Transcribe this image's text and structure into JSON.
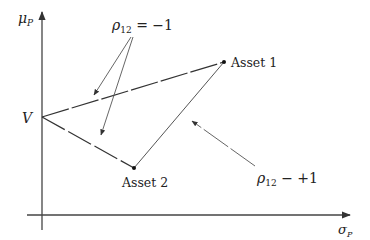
{
  "diagram": {
    "type": "portfolio-frontier",
    "axes": {
      "y_label": "μ",
      "y_label_sub": "P",
      "x_label": "σ",
      "x_label_sub": "P"
    },
    "points": {
      "v": {
        "label": "V",
        "x": 42,
        "y": 117
      },
      "asset1": {
        "label": "Asset 1",
        "x": 224,
        "y": 62
      },
      "asset2": {
        "label": "Asset 2",
        "x": 134,
        "y": 168
      }
    },
    "annotations": {
      "rho_minus": {
        "symbol": "ρ",
        "sub": "12",
        "rest": " = −1"
      },
      "rho_plus": {
        "symbol": "ρ",
        "sub": "12",
        "rest": " − +1"
      }
    }
  }
}
